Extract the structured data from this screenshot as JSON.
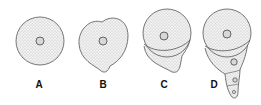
{
  "figure": {
    "panels": [
      {
        "label": "A",
        "description": "spherical cell with central nucleus"
      },
      {
        "label": "B",
        "description": "cell with small protrusion at bottom"
      },
      {
        "label": "C",
        "description": "cell with constriction forming a lower lobe"
      },
      {
        "label": "D",
        "description": "cell elongated into segmented tail with multiple nuclei"
      }
    ],
    "colors": {
      "stipple": "#8a8a8a",
      "outline": "#444444",
      "background": "#ffffff"
    }
  }
}
